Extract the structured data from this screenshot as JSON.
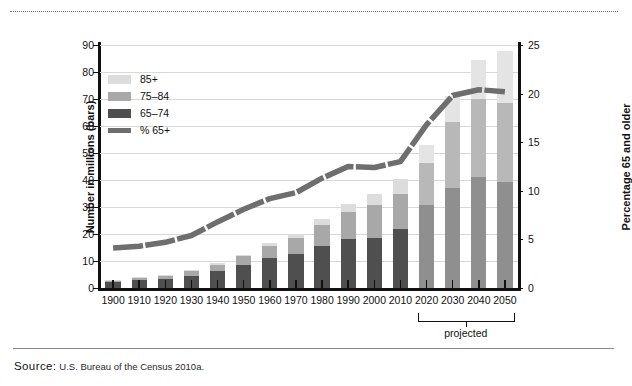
{
  "source": {
    "label": "Source:",
    "text": "U.S. Bureau of the Census 2010a."
  },
  "legend": {
    "items": [
      {
        "label": "85+",
        "color": "#dcdcdc",
        "type": "swatch"
      },
      {
        "label": "75–84",
        "color": "#a8a8a8",
        "type": "swatch"
      },
      {
        "label": "65–74",
        "color": "#4f4f4f",
        "type": "swatch"
      },
      {
        "label": "% 65+",
        "color": "#6e6e6e",
        "type": "line"
      }
    ]
  },
  "annotations": {
    "projected": "projected"
  },
  "chart_data": {
    "type": "bar",
    "title": "",
    "xlabel": "",
    "ylabel": "Number in millions (bars)",
    "ylabel_right": "Percentage 65 and older",
    "categories": [
      "1900",
      "1910",
      "1920",
      "1930",
      "1940",
      "1950",
      "1960",
      "1970",
      "1980",
      "1990",
      "2000",
      "2010",
      "2020",
      "2030",
      "2040",
      "2050"
    ],
    "ylim": [
      0,
      90
    ],
    "yticks": [
      0,
      10,
      20,
      30,
      40,
      50,
      60,
      70,
      80,
      90
    ],
    "ylim_right": [
      0,
      25
    ],
    "yticks_right": [
      0,
      5,
      10,
      15,
      20,
      25
    ],
    "grid": true,
    "legend_position": "upper-left",
    "series": [
      {
        "name": "65–74",
        "color": "#4f4f4f",
        "projected_color": "#8f8f8f",
        "values": [
          2.2,
          3.0,
          3.5,
          4.6,
          6.4,
          8.4,
          11.0,
          12.5,
          15.6,
          18.0,
          18.4,
          21.7,
          30.9,
          37.1,
          41.0,
          39.4
        ]
      },
      {
        "name": "75–84",
        "color": "#a8a8a8",
        "projected_color": "#b8b8b8",
        "values": [
          0.8,
          1.0,
          1.3,
          1.6,
          2.3,
          3.3,
          4.6,
          6.1,
          7.7,
          10.1,
          12.4,
          13.1,
          15.4,
          24.5,
          29.1,
          29.2
        ]
      },
      {
        "name": "85+",
        "color": "#dcdcdc",
        "projected_color": "#e4e4e4",
        "values": [
          0.1,
          0.2,
          0.2,
          0.3,
          0.4,
          0.6,
          0.9,
          1.4,
          2.2,
          3.1,
          4.2,
          5.5,
          6.6,
          9.6,
          14.2,
          19.0
        ]
      }
    ],
    "line_series": {
      "name": "% 65+",
      "color": "#6e6e6e",
      "axis": "right",
      "values": [
        4.1,
        4.3,
        4.7,
        5.4,
        6.8,
        8.1,
        9.2,
        9.8,
        11.3,
        12.5,
        12.4,
        13.0,
        16.8,
        19.8,
        20.4,
        20.2
      ]
    },
    "projected_from": "2020"
  }
}
